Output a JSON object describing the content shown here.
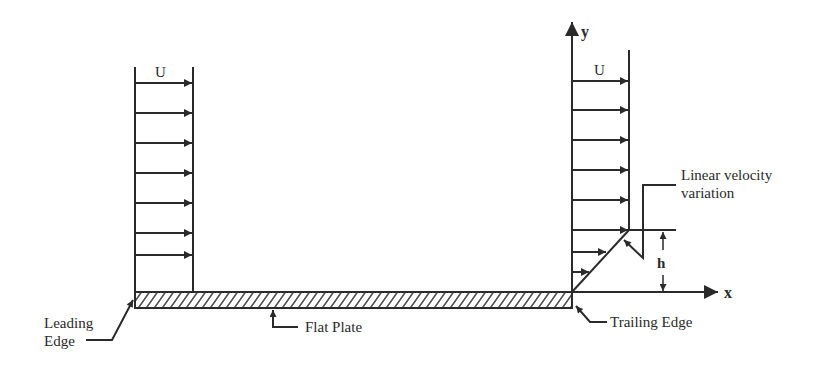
{
  "diagram": {
    "colors": {
      "ink": "#2a2a2a",
      "background": "#ffffff"
    },
    "labels": {
      "u_left": "U",
      "u_right": "U",
      "y_axis": "y",
      "x_axis": "x",
      "h": "h",
      "linear_variation_line1": "Linear velocity",
      "linear_variation_line2": "variation",
      "leading_edge_line1": "Leading",
      "leading_edge_line2": "Edge",
      "flat_plate": "Flat Plate",
      "trailing_edge": "Trailing Edge"
    },
    "left_profile": {
      "x_left": 135,
      "x_right": 193,
      "y_top": 67,
      "y_bottom": 292,
      "arrow_y": [
        83,
        113,
        143,
        173,
        203,
        233,
        255
      ]
    },
    "right_profile": {
      "x_left": 572,
      "x_right": 629,
      "y_top": 50,
      "y_linear_top": 230,
      "uniform_arrow_y": [
        81,
        110,
        140,
        170,
        200,
        230
      ],
      "linear_arrows": [
        {
          "y": 252,
          "x_end": 606
        },
        {
          "y": 272,
          "x_end": 590
        }
      ]
    },
    "plate": {
      "x_start": 135,
      "x_end": 572,
      "y_top": 292,
      "y_bottom": 308
    }
  }
}
